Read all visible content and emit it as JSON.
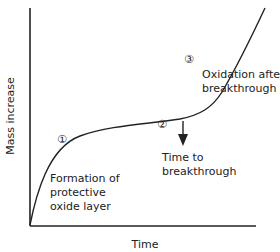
{
  "diagram": {
    "xlabel": "Time",
    "ylabel": "Mass increase",
    "markers": [
      {
        "id": "1",
        "glyph": "①"
      },
      {
        "id": "2",
        "glyph": "②"
      },
      {
        "id": "3",
        "glyph": "③"
      }
    ],
    "annotations": {
      "stage1": [
        "Formation of",
        "protective",
        "oxide layer"
      ],
      "breakthrough": [
        "Time to",
        "breakthrough"
      ],
      "stage3": [
        "Oxidation after",
        "breakthrough"
      ]
    },
    "colors": {
      "line": "#222222",
      "text": "#222222"
    }
  }
}
